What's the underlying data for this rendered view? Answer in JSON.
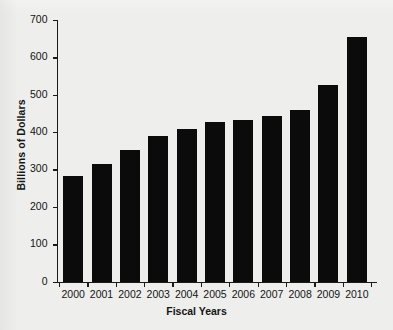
{
  "chart_data": {
    "type": "bar",
    "title": "",
    "xlabel": "Fiscal Years",
    "ylabel": "Billions of Dollars",
    "categories": [
      "2000",
      "2001",
      "2002",
      "2003",
      "2004",
      "2005",
      "2006",
      "2007",
      "2008",
      "2009",
      "2010"
    ],
    "values": [
      282,
      316,
      351,
      390,
      408,
      426,
      432,
      442,
      460,
      527,
      655
    ],
    "ylim": [
      0,
      700
    ],
    "yticks": [
      0,
      100,
      200,
      300,
      400,
      500,
      600,
      700
    ],
    "ytick_labels": [
      "0",
      "100",
      "200",
      "300",
      "400",
      "500",
      "600",
      "700"
    ],
    "grid": false,
    "legend": null,
    "bar_color": "#0b0b0b",
    "background_color": "#eeeeec",
    "axis_color": "#1a1a1a"
  }
}
